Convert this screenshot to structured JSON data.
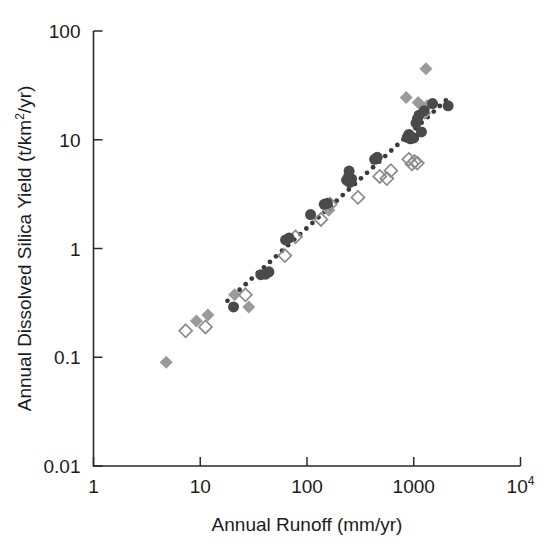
{
  "chart_data": {
    "type": "scatter",
    "title": "",
    "xlabel": "Annual Runoff (mm/yr)",
    "ylabel": "Annual Dissolved Silica Yield (t/km2/yr)",
    "ylabel_display": "Annual Dissolved Silica Yield (t/km",
    "ylabel_sup": "2",
    "ylabel_tail": "/yr)",
    "xscale": "log",
    "yscale": "log",
    "xlim": [
      1,
      10000
    ],
    "ylim": [
      0.01,
      100
    ],
    "grid": false,
    "legend": "none",
    "xticks": [
      {
        "value": 1,
        "label": "1",
        "sup": ""
      },
      {
        "value": 10,
        "label": "10",
        "sup": ""
      },
      {
        "value": 100,
        "label": "100",
        "sup": ""
      },
      {
        "value": 1000,
        "label": "1000",
        "sup": ""
      },
      {
        "value": 10000,
        "label": "10",
        "sup": "4"
      }
    ],
    "yticks": [
      {
        "value": 0.01,
        "label": "0.01"
      },
      {
        "value": 0.1,
        "label": "0.1"
      },
      {
        "value": 1,
        "label": "1"
      },
      {
        "value": 10,
        "label": "10"
      },
      {
        "value": 100,
        "label": "100"
      }
    ],
    "series": [
      {
        "name": "filled-diamonds",
        "marker": "filled-diamond",
        "color": "#9a9a9a",
        "size": 13,
        "points": [
          [
            4.8,
            0.09
          ],
          [
            9.2,
            0.215
          ],
          [
            11.8,
            0.245
          ],
          [
            21.0,
            0.375
          ],
          [
            28.5,
            0.29
          ],
          [
            160,
            2.25
          ],
          [
            850,
            24.5
          ],
          [
            1100,
            22.0
          ],
          [
            1300,
            45.0
          ],
          [
            1330,
            20.5
          ],
          [
            1270,
            17.5
          ]
        ]
      },
      {
        "name": "open-diamonds",
        "marker": "open-diamond",
        "color": "#8c8c8c",
        "size": 13,
        "points": [
          [
            7.3,
            0.175
          ],
          [
            11.2,
            0.19
          ],
          [
            26.5,
            0.375
          ],
          [
            62,
            0.86
          ],
          [
            78,
            1.28
          ],
          [
            135,
            1.85
          ],
          [
            165,
            2.55
          ],
          [
            300,
            2.95
          ],
          [
            480,
            4.6
          ],
          [
            560,
            4.4
          ],
          [
            610,
            5.2
          ],
          [
            900,
            6.6
          ],
          [
            960,
            6.0
          ],
          [
            1020,
            6.3
          ],
          [
            1080,
            6.1
          ]
        ]
      },
      {
        "name": "filled-circles",
        "marker": "filled-circle",
        "color": "#4a4a4a",
        "size": 11,
        "points": [
          [
            20.5,
            0.29
          ],
          [
            37,
            0.575
          ],
          [
            41,
            0.58
          ],
          [
            44,
            0.61
          ],
          [
            63,
            1.2
          ],
          [
            68,
            1.25
          ],
          [
            108,
            2.05
          ],
          [
            145,
            2.55
          ],
          [
            155,
            2.6
          ],
          [
            235,
            4.25
          ],
          [
            245,
            4.6
          ],
          [
            248,
            5.15
          ],
          [
            252,
            4.05
          ],
          [
            262,
            4.35
          ],
          [
            430,
            6.6
          ],
          [
            455,
            6.9
          ],
          [
            870,
            10.5
          ],
          [
            900,
            11.2
          ],
          [
            930,
            10.2
          ],
          [
            950,
            10.6
          ],
          [
            1000,
            10.4
          ],
          [
            1050,
            14.2
          ],
          [
            1080,
            15.5
          ],
          [
            1120,
            16.8
          ],
          [
            1180,
            11.8
          ],
          [
            1250,
            18.5
          ],
          [
            1500,
            21.5
          ],
          [
            2100,
            20.5
          ]
        ]
      }
    ],
    "trendline": {
      "name": "dotted-fit",
      "style": "dotted",
      "color": "#3a3a3a",
      "start": [
        18,
        0.33
      ],
      "end": [
        2000,
        23.0
      ]
    }
  }
}
